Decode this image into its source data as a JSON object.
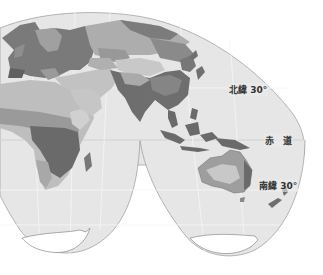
{
  "map": {
    "projection": "interrupted homolosine (lobed)",
    "style": "grayscale climate zones",
    "regions_visible": [
      "Europe",
      "Asia",
      "Middle East",
      "Africa",
      "Indian subcontinent",
      "Southeast Asia",
      "Indonesia",
      "Australia",
      "New Zealand",
      "Madagascar",
      "Antarctica"
    ],
    "colors": {
      "ocean": "#e6e6e6",
      "background": "#ffffff",
      "zone_dark": "#6e6e6e",
      "zone_mid": "#9a9a9a",
      "zone_light": "#bdbdbd",
      "zone_pale": "#d4d4d4",
      "graticule": "#f6f6f6",
      "outline": "#8a8a8a"
    }
  },
  "labels": {
    "north30": "北緯 30°",
    "equator": "赤　道",
    "south30": "南緯 30°"
  }
}
